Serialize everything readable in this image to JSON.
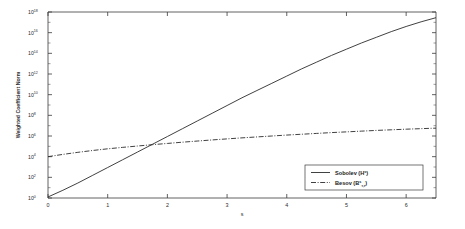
{
  "chart_data": {
    "type": "line",
    "title": "",
    "xlabel": "s",
    "ylabel": "Weighted Coefficient Norm",
    "xlim": [
      0,
      6.5
    ],
    "ylim": [
      1,
      1e+18
    ],
    "yscale": "log",
    "xscale": "linear",
    "grid": false,
    "legend_position": "lower right",
    "xticks": [
      0,
      1,
      2,
      3,
      4,
      5,
      6
    ],
    "xticklabels": [
      "0",
      "1",
      "2",
      "3",
      "4",
      "5",
      "6"
    ],
    "yticks": [
      1,
      100,
      10000,
      1000000,
      100000000,
      10000000000,
      1000000000000,
      100000000000000,
      10000000000000000,
      1000000000000000000
    ],
    "yticklabels": [
      "10^0",
      "10^2",
      "10^4",
      "10^6",
      "10^8",
      "10^10",
      "10^12",
      "10^14",
      "10^16",
      "10^18"
    ],
    "ytick_exponents": [
      "0",
      "2",
      "4",
      "6",
      "8",
      "10",
      "12",
      "14",
      "16",
      "18"
    ],
    "ytick_mantissa": "10",
    "series": [
      {
        "name": "Sobolev (H^s)",
        "label_base": "Sobolev (H",
        "label_sup": "s",
        "label_close": ")",
        "linestyle": "solid",
        "color": "#2b2b2b",
        "x": [
          0,
          0.25,
          0.5,
          0.75,
          1,
          1.25,
          1.5,
          1.75,
          2,
          2.25,
          2.5,
          2.75,
          3,
          3.25,
          3.5,
          3.75,
          4,
          4.25,
          4.5,
          4.75,
          5,
          5.25,
          5.5,
          5.75,
          6,
          6.25,
          6.5
        ],
        "y_log10": [
          0.1,
          0.75,
          1.45,
          2.2,
          2.95,
          3.7,
          4.45,
          5.2,
          5.95,
          6.7,
          7.45,
          8.2,
          8.95,
          9.7,
          10.4,
          11.1,
          11.8,
          12.5,
          13.15,
          13.8,
          14.4,
          15.0,
          15.55,
          16.1,
          16.6,
          17.05,
          17.45
        ]
      },
      {
        "name": "Besov (B^s_{tau,tau})",
        "label_base": "Besov (B",
        "label_sup": "s",
        "label_sub": "τ,τ",
        "label_close": ")",
        "linestyle": "dashdot",
        "color": "#2b2b2b",
        "x": [
          0,
          0.25,
          0.5,
          0.75,
          1,
          1.25,
          1.5,
          1.75,
          2,
          2.25,
          2.5,
          2.75,
          3,
          3.25,
          3.5,
          3.75,
          4,
          4.25,
          4.5,
          4.75,
          5,
          5.25,
          5.5,
          5.75,
          6,
          6.25,
          6.5
        ],
        "y_log10": [
          4.0,
          4.22,
          4.42,
          4.6,
          4.76,
          4.9,
          5.03,
          5.16,
          5.28,
          5.4,
          5.51,
          5.62,
          5.72,
          5.82,
          5.91,
          6.0,
          6.09,
          6.17,
          6.25,
          6.33,
          6.4,
          6.47,
          6.54,
          6.6,
          6.66,
          6.71,
          6.76
        ]
      }
    ],
    "annotations": [],
    "crossing_point": {
      "x": 1.75,
      "y_log10": 5.2
    }
  },
  "legend": {
    "entries": [
      {
        "label": "Sobolev (H",
        "sup": "s",
        "close": ")"
      },
      {
        "label": "Besov (B",
        "sup": "s",
        "sub": "τ,τ",
        "close": ")"
      }
    ]
  },
  "axes": {
    "y_title": "Weighted Coefficient Norm",
    "x_title": "s"
  },
  "colors": {
    "background": "#ffffff",
    "axis": "#3a3a3a",
    "line": "#2b2b2b",
    "text": "#2b2b2b"
  }
}
